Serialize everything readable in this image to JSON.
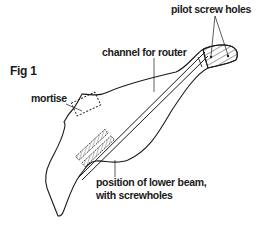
{
  "figure": {
    "title": "Fig 1",
    "labels": {
      "mortise": "mortise",
      "channel": "channel for router",
      "pilot_holes": "pilot screw holes",
      "lower_beam_line1": "position of lower beam,",
      "lower_beam_line2": "with screwholes"
    }
  },
  "colors": {
    "line": "#1a1a1a",
    "background": "#ffffff"
  }
}
